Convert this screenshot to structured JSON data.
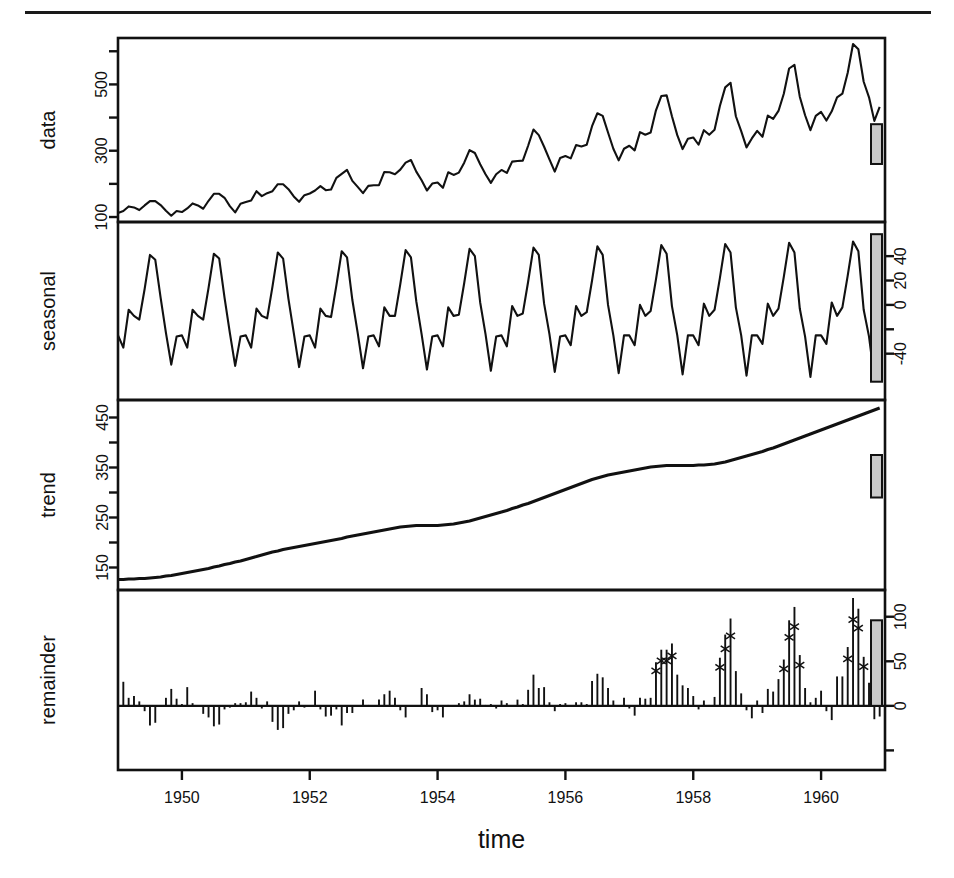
{
  "figure": {
    "kind": "stl-decomposition",
    "top_rule": true,
    "xlabel": "time",
    "x_ticks": [
      "1950",
      "1952",
      "1954",
      "1956",
      "1958",
      "1960"
    ],
    "x_tick_values": [
      1950,
      1952,
      1954,
      1956,
      1958,
      1960
    ],
    "xlim": [
      1949.0,
      1961.0
    ]
  },
  "panels": {
    "data": {
      "label": "data",
      "label_side": "left",
      "tick_side": "left",
      "ticks": [
        "100",
        "300",
        "500"
      ],
      "tick_values": [
        100,
        300,
        500
      ],
      "minor_tick_values": [
        200,
        400,
        600
      ],
      "ylim": [
        85,
        640
      ],
      "scalebar_low": 260,
      "scalebar_high": 380
    },
    "seasonal": {
      "label": "seasonal",
      "label_side": "left",
      "tick_side": "right",
      "ticks": [
        "40",
        "20",
        "0",
        "-40"
      ],
      "tick_values": [
        40,
        20,
        0,
        -40
      ],
      "minor_tick_values": [
        -20
      ],
      "ylim": [
        -78,
        68
      ],
      "scalebar_low": -63,
      "scalebar_high": 58
    },
    "trend": {
      "label": "trend",
      "label_side": "left",
      "tick_side": "left",
      "ticks": [
        "150",
        "250",
        "350",
        "450"
      ],
      "tick_values": [
        150,
        250,
        350,
        450
      ],
      "minor_tick_values": [
        200,
        300,
        400,
        500
      ],
      "ylim": [
        105,
        485
      ],
      "scalebar_low": 290,
      "scalebar_high": 375
    },
    "remainder": {
      "label": "remainder",
      "label_side": "left",
      "tick_side": "right",
      "ticks": [
        "100",
        "50",
        "0"
      ],
      "tick_values": [
        100,
        50,
        0
      ],
      "minor_tick_values": [
        -50
      ],
      "ylim": [
        -72,
        130
      ],
      "scalebar_low": 0,
      "scalebar_high": 96
    }
  },
  "chart_data": {
    "type": "line",
    "title": "",
    "subtitle": "",
    "xlabel": "time",
    "ylabel": "",
    "xlim": [
      1949.0,
      1961.0
    ],
    "grid": false,
    "legend": "none",
    "x_start": 1949.0,
    "x_step": 0.0833333,
    "n": 144,
    "series": [
      {
        "name": "data",
        "panel": "data",
        "ylabel": "data",
        "ylim": [
          85,
          640
        ],
        "yticks": [
          100,
          300,
          500
        ],
        "style": "line",
        "values": [
          112,
          118,
          132,
          129,
          121,
          135,
          148,
          148,
          136,
          119,
          104,
          118,
          115,
          126,
          141,
          135,
          125,
          149,
          170,
          170,
          158,
          133,
          114,
          140,
          145,
          150,
          178,
          163,
          172,
          178,
          199,
          199,
          184,
          162,
          146,
          166,
          171,
          180,
          193,
          181,
          183,
          218,
          230,
          242,
          209,
          191,
          172,
          194,
          196,
          196,
          236,
          235,
          229,
          243,
          264,
          272,
          237,
          211,
          180,
          201,
          204,
          188,
          235,
          227,
          234,
          264,
          302,
          293,
          259,
          229,
          203,
          229,
          242,
          233,
          267,
          269,
          270,
          315,
          364,
          347,
          312,
          274,
          237,
          278,
          284,
          277,
          317,
          313,
          318,
          374,
          413,
          405,
          355,
          306,
          271,
          306,
          315,
          301,
          356,
          348,
          355,
          422,
          465,
          467,
          404,
          347,
          305,
          336,
          340,
          318,
          362,
          348,
          363,
          435,
          491,
          505,
          404,
          359,
          310,
          337,
          360,
          342,
          406,
          396,
          420,
          472,
          548,
          559,
          463,
          407,
          362,
          405,
          417,
          391,
          419,
          461,
          472,
          535,
          622,
          606,
          508,
          461,
          390,
          432
        ]
      },
      {
        "name": "seasonal",
        "panel": "seasonal",
        "ylabel": "seasonal",
        "ylim": [
          -78,
          68
        ],
        "yticks": [
          -40,
          0,
          20,
          40
        ],
        "style": "line",
        "values": [
          -25,
          -35,
          -4,
          -9,
          -12,
          13,
          41,
          37,
          6,
          -23,
          -49,
          -26,
          -25,
          -35,
          -4,
          -9,
          -12,
          14,
          42,
          38,
          6,
          -23,
          -50,
          -26,
          -25,
          -35,
          -3,
          -9,
          -11,
          15,
          43,
          38,
          5,
          -23,
          -51,
          -26,
          -25,
          -35,
          -3,
          -9,
          -10,
          16,
          44,
          39,
          4,
          -23,
          -52,
          -26,
          -25,
          -34,
          -2,
          -9,
          -9,
          17,
          45,
          39,
          3,
          -24,
          -53,
          -26,
          -25,
          -34,
          -2,
          -9,
          -8,
          18,
          46,
          40,
          2,
          -24,
          -54,
          -26,
          -25,
          -34,
          -1,
          -9,
          -7,
          19,
          47,
          41,
          1,
          -24,
          -55,
          -26,
          -25,
          -33,
          -1,
          -9,
          -6,
          20,
          48,
          41,
          0,
          -25,
          -56,
          -25,
          -25,
          -33,
          0,
          -9,
          -5,
          21,
          49,
          42,
          -1,
          -25,
          -57,
          -25,
          -25,
          -33,
          1,
          -9,
          -4,
          22,
          50,
          43,
          -2,
          -25,
          -58,
          -25,
          -25,
          -32,
          1,
          -9,
          -3,
          23,
          51,
          43,
          -3,
          -26,
          -59,
          -25,
          -25,
          -32,
          2,
          -9,
          -2,
          24,
          52,
          44,
          -4,
          -26,
          -60,
          -25
        ]
      },
      {
        "name": "trend",
        "panel": "trend",
        "ylabel": "trend",
        "ylim": [
          105,
          485
        ],
        "yticks": [
          150,
          250,
          350,
          450
        ],
        "style": "line",
        "values": [
          126,
          126,
          127,
          127,
          128,
          128,
          129,
          130,
          131,
          133,
          134,
          136,
          138,
          140,
          142,
          144,
          146,
          148,
          151,
          153,
          156,
          158,
          161,
          163,
          166,
          169,
          172,
          175,
          178,
          181,
          183,
          186,
          188,
          190,
          192,
          194,
          196,
          198,
          200,
          202,
          204,
          206,
          208,
          211,
          213,
          215,
          217,
          219,
          221,
          223,
          225,
          227,
          229,
          231,
          232,
          233,
          234,
          234,
          234,
          234,
          234,
          235,
          236,
          237,
          239,
          241,
          243,
          246,
          249,
          252,
          255,
          258,
          261,
          264,
          268,
          271,
          275,
          278,
          282,
          286,
          290,
          294,
          298,
          302,
          306,
          310,
          314,
          318,
          322,
          326,
          329,
          332,
          335,
          337,
          339,
          341,
          343,
          345,
          347,
          349,
          351,
          352,
          353,
          354,
          354,
          354,
          354,
          354,
          354,
          355,
          355,
          356,
          357,
          359,
          361,
          364,
          367,
          370,
          373,
          376,
          379,
          382,
          386,
          389,
          393,
          397,
          401,
          405,
          409,
          413,
          417,
          421,
          425,
          429,
          433,
          437,
          441,
          445,
          449,
          453,
          457,
          461,
          465,
          469
        ]
      },
      {
        "name": "remainder",
        "panel": "remainder",
        "ylabel": "remainder",
        "ylim": [
          -72,
          130
        ],
        "yticks": [
          0,
          50,
          100
        ],
        "style": "spike",
        "values": [
          11,
          27,
          9,
          11,
          5,
          -6,
          -22,
          -19,
          -1,
          9,
          19,
          8,
          2,
          21,
          3,
          0,
          -9,
          -13,
          -23,
          -21,
          -4,
          -2,
          3,
          3,
          4,
          16,
          9,
          -3,
          5,
          -18,
          -27,
          -25,
          -9,
          -5,
          5,
          -2,
          0,
          17,
          -4,
          -12,
          -11,
          -4,
          -22,
          -8,
          -8,
          -1,
          7,
          1,
          0,
          7,
          13,
          17,
          9,
          -5,
          -13,
          0,
          0,
          20,
          13,
          -7,
          -5,
          -13,
          1,
          -1,
          3,
          5,
          13,
          7,
          8,
          1,
          2,
          -3,
          6,
          3,
          0,
          7,
          2,
          18,
          35,
          20,
          21,
          4,
          -6,
          2,
          3,
          0,
          4,
          4,
          2,
          28,
          36,
          32,
          20,
          6,
          -1,
          9,
          -3,
          -11,
          9,
          8,
          9,
          49,
          63,
          63,
          70,
          35,
          23,
          20,
          11,
          -4,
          6,
          1,
          10,
          54,
          80,
          98,
          39,
          14,
          -5,
          -14,
          6,
          -8,
          19,
          16,
          30,
          52,
          96,
          111,
          57,
          20,
          4,
          9,
          17,
          -6,
          -16,
          33,
          33,
          66,
          121,
          109,
          55,
          26,
          -15,
          -12
        ]
      }
    ],
    "remainder_outliers_note": "crosses mark large positive residuals in later years"
  },
  "scalebars": {
    "note": "gray reference bars of equal data-units shown at right of each panel",
    "fill_color": "#c9c9c9",
    "stroke_color": "#111111"
  }
}
